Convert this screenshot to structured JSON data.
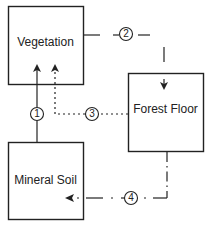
{
  "diagram": {
    "nodes": [
      {
        "id": "vegetation",
        "label": "Vegetation"
      },
      {
        "id": "forest_floor",
        "label": "Forest Floor"
      },
      {
        "id": "mineral_soil",
        "label": "Mineral Soil"
      }
    ],
    "flows": [
      {
        "number": "1",
        "from": "mineral_soil",
        "to": "vegetation",
        "style": "solid"
      },
      {
        "number": "2",
        "from": "vegetation",
        "to": "forest_floor",
        "style": "dashed"
      },
      {
        "number": "3",
        "from": "forest_floor",
        "to": "vegetation",
        "style": "dotted"
      },
      {
        "number": "4",
        "from": "forest_floor",
        "to": "mineral_soil",
        "style": "dash-dot"
      }
    ],
    "colors": {
      "line": "#222222",
      "background": "#ffffff"
    }
  }
}
